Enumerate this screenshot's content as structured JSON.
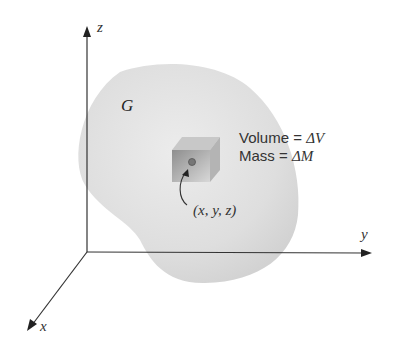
{
  "diagram": {
    "axes": {
      "x_label": "x",
      "y_label": "y",
      "z_label": "z"
    },
    "region_label": "G",
    "volume_label": "Volume = ",
    "volume_symbol": "ΔV",
    "mass_label": "Mass = ",
    "mass_symbol": "ΔM",
    "point_label": "(x, y, z)",
    "colors": {
      "region": "#dcdcdc",
      "axis": "#333333",
      "cube": "#a8a8a8"
    }
  }
}
